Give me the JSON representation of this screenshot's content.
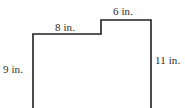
{
  "figure": {
    "name": "step-polygon-with-dimensions",
    "units": "in.",
    "stroke_color": "#231f20",
    "fill_color": "#ffffff",
    "background_color": "#ffffff",
    "text_color": "#2b2b2b",
    "stroke_width": 1.6,
    "cropped_at_bottom": true
  },
  "labels": {
    "top_left": "8 in.",
    "top_right": "6 in.",
    "left": "9 in.",
    "right": "11 in."
  },
  "chart_data": {
    "type": "diagram",
    "title": "",
    "shape": "step-polygon",
    "dimensions": [
      {
        "id": "top-left-edge",
        "label": "8 in.",
        "value": 8,
        "unit": "in.",
        "orientation": "horizontal",
        "position": "top-left"
      },
      {
        "id": "top-right-edge",
        "label": "6 in.",
        "value": 6,
        "unit": "in.",
        "orientation": "horizontal",
        "position": "top-right"
      },
      {
        "id": "left-edge",
        "label": "9 in.",
        "value": 9,
        "unit": "in.",
        "orientation": "vertical",
        "position": "left"
      },
      {
        "id": "right-edge",
        "label": "11 in.",
        "value": 11,
        "unit": "in.",
        "orientation": "vertical",
        "position": "right"
      }
    ],
    "vertices_px": [
      [
        33,
        108
      ],
      [
        33,
        34
      ],
      [
        101,
        34
      ],
      [
        101,
        20
      ],
      [
        151,
        20
      ],
      [
        151,
        108
      ]
    ]
  }
}
